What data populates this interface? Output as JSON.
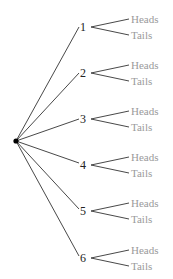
{
  "diagram": {
    "type": "tree",
    "root": {
      "x": 16,
      "y": 141
    },
    "colors": {
      "line": "#333333",
      "number_text": "#222222",
      "outcome_text": "#9a9a9a",
      "root_dot": "#000000"
    },
    "branches": [
      {
        "label": "1",
        "y": 27,
        "outcomes": [
          "Heads",
          "Tails"
        ]
      },
      {
        "label": "2",
        "y": 73,
        "outcomes": [
          "Heads",
          "Tails"
        ]
      },
      {
        "label": "3",
        "y": 119,
        "outcomes": [
          "Heads",
          "Tails"
        ]
      },
      {
        "label": "4",
        "y": 165,
        "outcomes": [
          "Heads",
          "Tails"
        ]
      },
      {
        "label": "5",
        "y": 211,
        "outcomes": [
          "Heads",
          "Tails"
        ]
      },
      {
        "label": "6",
        "y": 258,
        "outcomes": [
          "Heads",
          "Tails"
        ]
      }
    ]
  }
}
